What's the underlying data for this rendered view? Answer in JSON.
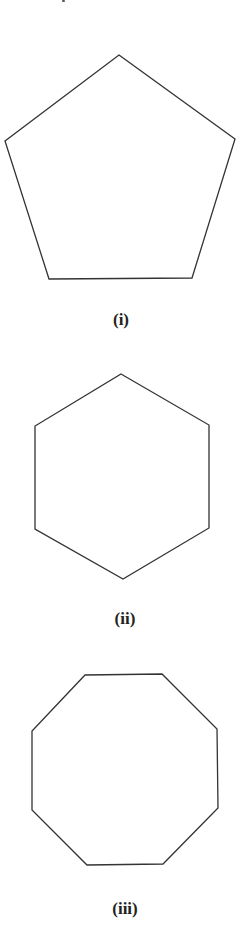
{
  "figure": {
    "stroke_color": "#333333",
    "background": "#ffffff",
    "shapes": [
      {
        "name": "pentagon",
        "sides": 5,
        "label": "(i)",
        "points": "119,55 235,139 192,278 49,279 5,141",
        "label_x": 121,
        "label_y": 311
      },
      {
        "name": "hexagon",
        "sides": 6,
        "label": "(ii)",
        "points": "121,374 209,425 209,528 123,579 35,529 35,426",
        "label_x": 125,
        "label_y": 610
      },
      {
        "name": "octagon",
        "sides": 8,
        "label": "(iii)",
        "points": "85,675 162,674 217,729 218,808 163,864 87,865 32,810 32,731",
        "label_x": 125,
        "label_y": 900
      }
    ]
  }
}
